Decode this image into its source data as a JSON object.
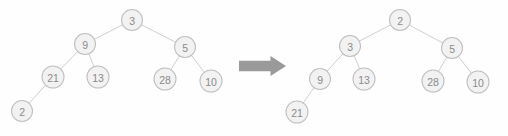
{
  "diagram": {
    "background_color": "#fefefe",
    "node_fill": "#f2f2f2",
    "node_stroke": "#bfbfbf",
    "node_text_color": "#8a8a8a",
    "edge_color": "#c9c9c9",
    "arrow_color": "#9a9a9a",
    "node_radius": 10.5
  },
  "left_tree": {
    "name": "original-tree",
    "root_value": "3",
    "nodes": [
      {
        "id": "L0",
        "label": "3",
        "cx": 132,
        "cy": 20,
        "r": 10.5
      },
      {
        "id": "L1",
        "label": "9",
        "cx": 85,
        "cy": 44,
        "r": 10.5
      },
      {
        "id": "L2",
        "label": "5",
        "cx": 185,
        "cy": 47,
        "r": 10.5
      },
      {
        "id": "L3",
        "label": "21",
        "cx": 53,
        "cy": 77,
        "r": 11.0
      },
      {
        "id": "L4",
        "label": "13",
        "cx": 98,
        "cy": 77,
        "r": 11.0
      },
      {
        "id": "L5",
        "label": "28",
        "cx": 165,
        "cy": 79,
        "r": 11.0
      },
      {
        "id": "L6",
        "label": "10",
        "cx": 211,
        "cy": 81,
        "r": 11.0
      },
      {
        "id": "L7",
        "label": "2",
        "cx": 22,
        "cy": 111,
        "r": 10.5
      }
    ],
    "edges": [
      {
        "from": "L0",
        "to": "L1"
      },
      {
        "from": "L0",
        "to": "L2"
      },
      {
        "from": "L1",
        "to": "L3"
      },
      {
        "from": "L1",
        "to": "L4"
      },
      {
        "from": "L2",
        "to": "L5"
      },
      {
        "from": "L2",
        "to": "L6"
      },
      {
        "from": "L3",
        "to": "L7"
      }
    ]
  },
  "arrow": {
    "name": "transformation-arrow",
    "label": "transforms-to",
    "x": 239,
    "y": 56,
    "width": 47,
    "height": 20,
    "color": "#9a9a9a"
  },
  "right_tree": {
    "name": "result-tree",
    "root_value": "2",
    "nodes": [
      {
        "id": "R0",
        "label": "2",
        "cx": 400,
        "cy": 20,
        "r": 10.5
      },
      {
        "id": "R1",
        "label": "3",
        "cx": 350,
        "cy": 46,
        "r": 10.5
      },
      {
        "id": "R2",
        "label": "5",
        "cx": 452,
        "cy": 48,
        "r": 10.5
      },
      {
        "id": "R3",
        "label": "9",
        "cx": 320,
        "cy": 79,
        "r": 10.5
      },
      {
        "id": "R4",
        "label": "13",
        "cx": 364,
        "cy": 79,
        "r": 11.0
      },
      {
        "id": "R5",
        "label": "28",
        "cx": 433,
        "cy": 81,
        "r": 11.0
      },
      {
        "id": "R6",
        "label": "10",
        "cx": 478,
        "cy": 82,
        "r": 11.0
      },
      {
        "id": "R7",
        "label": "21",
        "cx": 297,
        "cy": 112,
        "r": 11.0
      }
    ],
    "edges": [
      {
        "from": "R0",
        "to": "R1"
      },
      {
        "from": "R0",
        "to": "R2"
      },
      {
        "from": "R1",
        "to": "R3"
      },
      {
        "from": "R1",
        "to": "R4"
      },
      {
        "from": "R2",
        "to": "R5"
      },
      {
        "from": "R2",
        "to": "R6"
      },
      {
        "from": "R3",
        "to": "R7"
      }
    ]
  }
}
